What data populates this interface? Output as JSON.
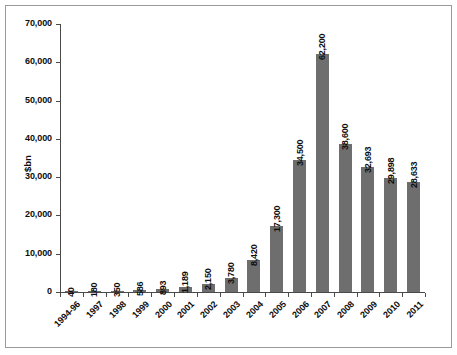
{
  "chart_data": {
    "type": "bar",
    "title": "",
    "subtitle": "",
    "xlabel": "",
    "ylabel": "$bn",
    "ylim": [
      0,
      70000
    ],
    "ytick_values": [
      0,
      10000,
      20000,
      30000,
      40000,
      50000,
      60000,
      70000
    ],
    "ytick_labels": [
      "0",
      "10,000",
      "20,000",
      "30,000",
      "40,000",
      "50,000",
      "60,000",
      "70,000"
    ],
    "grid": false,
    "legend": false,
    "legend_position": "none",
    "bar_color": "#6e6e6e",
    "axis_color": "#4a4a4a",
    "text_color": "#0d0d0d",
    "background_color": "#ffffff",
    "border_color": "#9a9a9a",
    "categories": [
      "1994-96",
      "1997",
      "1998",
      "1999",
      "2000",
      "2001",
      "2002",
      "2003",
      "2004",
      "2005",
      "2006",
      "2007",
      "2008",
      "2009",
      "2010",
      "2011"
    ],
    "values": [
      40,
      180,
      350,
      586,
      893,
      1189,
      2150,
      3780,
      8420,
      17300,
      34500,
      62200,
      38600,
      32693,
      29898,
      28633
    ],
    "value_labels": [
      "40",
      "180",
      "350",
      "586",
      "893",
      "1,189",
      "2,150",
      "3,780",
      "8,420",
      "17,300",
      "34,500",
      "62,200",
      "38,600",
      "32,693",
      "29,898",
      "28,633"
    ]
  }
}
